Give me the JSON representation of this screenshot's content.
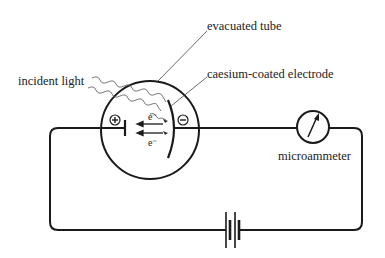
{
  "labels": {
    "evacuated_tube": "evacuated tube",
    "incident_light": "incident light",
    "electrode": "caesium-coated electrode",
    "microammeter": "microammeter",
    "electron_1": "e⁻",
    "electron_2": "e⁻",
    "anode_sign": "+",
    "cathode_sign": "−"
  },
  "colors": {
    "line": "#1a1a1a",
    "thin_line": "#444444",
    "background": "#ffffff"
  }
}
